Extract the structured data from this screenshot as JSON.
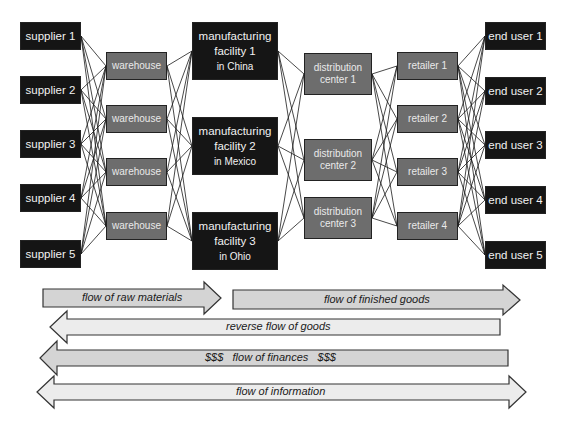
{
  "diagram": {
    "type": "supply-chain-network",
    "columns": [
      {
        "name": "suppliers",
        "nodes": [
          {
            "id": "s1",
            "label": "supplier 1"
          },
          {
            "id": "s2",
            "label": "supplier 2"
          },
          {
            "id": "s3",
            "label": "supplier 3"
          },
          {
            "id": "s4",
            "label": "supplier 4"
          },
          {
            "id": "s5",
            "label": "supplier 5"
          }
        ]
      },
      {
        "name": "warehouses",
        "nodes": [
          {
            "id": "w1",
            "label": "warehouse"
          },
          {
            "id": "w2",
            "label": "warehouse"
          },
          {
            "id": "w3",
            "label": "warehouse"
          },
          {
            "id": "w4",
            "label": "warehouse"
          }
        ]
      },
      {
        "name": "manufacturing",
        "nodes": [
          {
            "id": "m1",
            "line1": "manufacturing",
            "line2": "facility 1",
            "line3": "in China"
          },
          {
            "id": "m2",
            "line1": "manufacturing",
            "line2": "facility 2",
            "line3": "in Mexico"
          },
          {
            "id": "m3",
            "line1": "manufacturing",
            "line2": "facility 3",
            "line3": "in Ohio"
          }
        ]
      },
      {
        "name": "distribution",
        "nodes": [
          {
            "id": "d1",
            "line1": "distribution",
            "line2": "center 1"
          },
          {
            "id": "d2",
            "line1": "distribution",
            "line2": "center 2"
          },
          {
            "id": "d3",
            "line1": "distribution",
            "line2": "center 3"
          }
        ]
      },
      {
        "name": "retailers",
        "nodes": [
          {
            "id": "r1",
            "label": "retailer 1"
          },
          {
            "id": "r2",
            "label": "retailer 2"
          },
          {
            "id": "r3",
            "label": "retailer 3"
          },
          {
            "id": "r4",
            "label": "retailer 4"
          }
        ]
      },
      {
        "name": "end_users",
        "nodes": [
          {
            "id": "e1",
            "label": "end user 1"
          },
          {
            "id": "e2",
            "label": "end user 2"
          },
          {
            "id": "e3",
            "label": "end user 3"
          },
          {
            "id": "e4",
            "label": "end user 4"
          },
          {
            "id": "e5",
            "label": "end user 5"
          }
        ]
      }
    ],
    "connections": "each node is linked to every node in the adjacent column",
    "flows": [
      {
        "id": "raw",
        "label": "flow of raw materials",
        "direction": "right"
      },
      {
        "id": "finished",
        "label": "flow of finished goods",
        "direction": "right"
      },
      {
        "id": "reverse",
        "label": "reverse flow of goods",
        "direction": "left"
      },
      {
        "id": "finances",
        "label": "$$$   flow of finances   $$$",
        "direction": "left"
      },
      {
        "id": "information",
        "label": "flow of information",
        "direction": "both"
      }
    ]
  },
  "colors": {
    "dark_node": "#151515",
    "mid_node": "#6d6d6d",
    "arrow_dark_fill": "#d4d4d4",
    "arrow_light_fill": "#ececec"
  }
}
